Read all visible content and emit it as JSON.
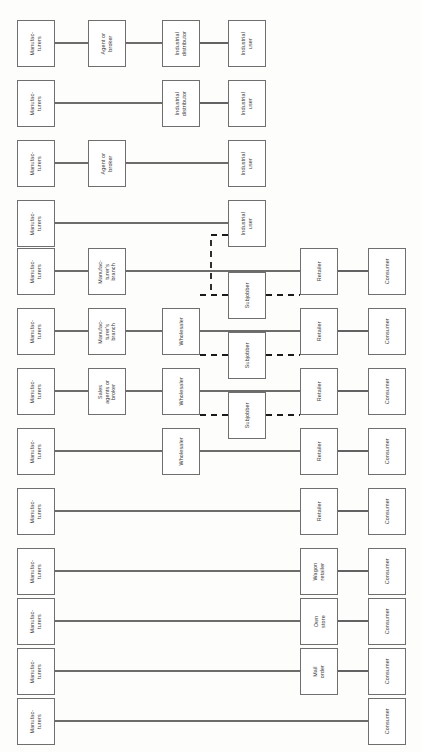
{
  "diagram": {
    "orientation": "rotated-90",
    "colors": {
      "box_border": "#6f6f6f",
      "box_fill": "#ffffff",
      "line": "#3b3b3b",
      "dashed_line": "#1a1a1a",
      "page_bg": "#fdfdfc",
      "text": "#3c3c3c"
    },
    "labels": {
      "manufacturers": "Manufac-\nturers",
      "agent_or_broker": "Agent or\nbroker",
      "industrial_distributor": "Industrial\ndistributor",
      "industrial_user": "Industrial\nuser",
      "manufacturers_branch": "Manufac-\nturer's\nbranch",
      "sales_agents_or_broker": "Sales\nagents or\nbroker",
      "wholesaler": "Wholesaler",
      "subjobber": "Subjobber",
      "retailer": "Retailer",
      "consumer": "Consumer",
      "wagon_retailer": "Wagon\nretailer",
      "own_store": "Own\nstore",
      "mail_order": "Mail\norder"
    },
    "columns": [
      {
        "key": "c1",
        "x": 17,
        "w": 38
      },
      {
        "key": "c2",
        "x": 88,
        "w": 38
      },
      {
        "key": "c3",
        "x": 162,
        "w": 38
      },
      {
        "key": "c4",
        "x": 228,
        "w": 38
      },
      {
        "key": "c5",
        "x": 300,
        "w": 38
      },
      {
        "key": "c6",
        "x": 368,
        "w": 38
      }
    ],
    "rows": [
      {
        "index": 1,
        "y": 20,
        "h": 47,
        "name": "manufacturer-agent-distributor-user",
        "nodes": [
          {
            "col": "c1",
            "label_key": "manufacturers",
            "name": "manufacturers-box"
          },
          {
            "col": "c2",
            "label_key": "agent_or_broker",
            "name": "agent-or-broker-box"
          },
          {
            "col": "c3",
            "label_key": "industrial_distributor",
            "name": "industrial-distributor-box"
          },
          {
            "col": "c4",
            "label_key": "industrial_user",
            "name": "industrial-user-box"
          }
        ]
      },
      {
        "index": 2,
        "y": 80,
        "h": 47,
        "name": "manufacturer-distributor-user",
        "nodes": [
          {
            "col": "c1",
            "label_key": "manufacturers",
            "name": "manufacturers-box"
          },
          {
            "col": "c3",
            "label_key": "industrial_distributor",
            "name": "industrial-distributor-box"
          },
          {
            "col": "c4",
            "label_key": "industrial_user",
            "name": "industrial-user-box"
          }
        ]
      },
      {
        "index": 3,
        "y": 140,
        "h": 47,
        "name": "manufacturer-agent-user",
        "nodes": [
          {
            "col": "c1",
            "label_key": "manufacturers",
            "name": "manufacturers-box"
          },
          {
            "col": "c2",
            "label_key": "agent_or_broker",
            "name": "agent-or-broker-box"
          },
          {
            "col": "c4",
            "label_key": "industrial_user",
            "name": "industrial-user-box"
          }
        ]
      },
      {
        "index": 4,
        "y": 200,
        "h": 47,
        "name": "manufacturer-user-direct",
        "nodes": [
          {
            "col": "c1",
            "label_key": "manufacturers",
            "name": "manufacturers-box"
          },
          {
            "col": "c4",
            "label_key": "industrial_user",
            "name": "industrial-user-box"
          }
        ]
      },
      {
        "index": 5,
        "y": 248,
        "h": 47,
        "name": "manufacturer-branch-retailer-consumer",
        "nodes": [
          {
            "col": "c1",
            "label_key": "manufacturers",
            "name": "manufacturers-box"
          },
          {
            "col": "c2",
            "label_key": "manufacturers_branch",
            "name": "manufacturers-branch-box"
          },
          {
            "col": "c5",
            "label_key": "retailer",
            "name": "retailer-box"
          },
          {
            "col": "c6",
            "label_key": "consumer",
            "name": "consumer-box"
          }
        ]
      },
      {
        "index": 6,
        "y": 308,
        "h": 47,
        "name": "manufacturer-branch-wholesaler-retailer-consumer",
        "nodes": [
          {
            "col": "c1",
            "label_key": "manufacturers",
            "name": "manufacturers-box"
          },
          {
            "col": "c2",
            "label_key": "manufacturers_branch",
            "name": "manufacturers-branch-box"
          },
          {
            "col": "c3",
            "label_key": "wholesaler",
            "name": "wholesaler-box"
          },
          {
            "col": "c5",
            "label_key": "retailer",
            "name": "retailer-box"
          },
          {
            "col": "c6",
            "label_key": "consumer",
            "name": "consumer-box"
          }
        ]
      },
      {
        "index": 7,
        "y": 368,
        "h": 47,
        "name": "manufacturer-salesagents-wholesaler-retailer-consumer",
        "nodes": [
          {
            "col": "c1",
            "label_key": "manufacturers",
            "name": "manufacturers-box"
          },
          {
            "col": "c2",
            "label_key": "sales_agents_or_broker",
            "name": "sales-agents-or-broker-box"
          },
          {
            "col": "c3",
            "label_key": "wholesaler",
            "name": "wholesaler-box"
          },
          {
            "col": "c5",
            "label_key": "retailer",
            "name": "retailer-box"
          },
          {
            "col": "c6",
            "label_key": "consumer",
            "name": "consumer-box"
          }
        ]
      },
      {
        "index": 8,
        "y": 428,
        "h": 47,
        "name": "manufacturer-wholesaler-retailer-consumer",
        "nodes": [
          {
            "col": "c1",
            "label_key": "manufacturers",
            "name": "manufacturers-box"
          },
          {
            "col": "c3",
            "label_key": "wholesaler",
            "name": "wholesaler-box"
          },
          {
            "col": "c5",
            "label_key": "retailer",
            "name": "retailer-box"
          },
          {
            "col": "c6",
            "label_key": "consumer",
            "name": "consumer-box"
          }
        ]
      },
      {
        "index": 9,
        "y": 488,
        "h": 47,
        "name": "manufacturer-retailer-consumer",
        "nodes": [
          {
            "col": "c1",
            "label_key": "manufacturers",
            "name": "manufacturers-box"
          },
          {
            "col": "c5",
            "label_key": "retailer",
            "name": "retailer-box"
          },
          {
            "col": "c6",
            "label_key": "consumer",
            "name": "consumer-box"
          }
        ]
      },
      {
        "index": 10,
        "y": 548,
        "h": 47,
        "name": "manufacturer-wagonretailer-consumer",
        "nodes": [
          {
            "col": "c1",
            "label_key": "manufacturers",
            "name": "manufacturers-box"
          },
          {
            "col": "c5",
            "label_key": "wagon_retailer",
            "name": "wagon-retailer-box"
          },
          {
            "col": "c6",
            "label_key": "consumer",
            "name": "consumer-box"
          }
        ]
      },
      {
        "index": 11,
        "y": 598,
        "h": 47,
        "name": "manufacturer-ownstore-consumer",
        "nodes": [
          {
            "col": "c1",
            "label_key": "manufacturers",
            "name": "manufacturers-box"
          },
          {
            "col": "c5",
            "label_key": "own_store",
            "name": "own-store-box"
          },
          {
            "col": "c6",
            "label_key": "consumer",
            "name": "consumer-box"
          }
        ]
      },
      {
        "index": 12,
        "y": 648,
        "h": 47,
        "name": "manufacturer-mailorder-consumer",
        "nodes": [
          {
            "col": "c1",
            "label_key": "manufacturers",
            "name": "manufacturers-box"
          },
          {
            "col": "c5",
            "label_key": "mail_order",
            "name": "mail-order-box"
          },
          {
            "col": "c6",
            "label_key": "consumer",
            "name": "consumer-box"
          }
        ]
      },
      {
        "index": 13,
        "y": 698,
        "h": 47,
        "name": "manufacturer-consumer-direct",
        "nodes": [
          {
            "col": "c1",
            "label_key": "manufacturers",
            "name": "manufacturers-box"
          },
          {
            "col": "c6",
            "label_key": "consumer",
            "name": "consumer-box"
          }
        ]
      }
    ],
    "subjobbers": [
      {
        "x": 228,
        "y": 272,
        "w": 38,
        "h": 47,
        "label_key": "subjobber",
        "name": "subjobber-box"
      },
      {
        "x": 228,
        "y": 332,
        "w": 38,
        "h": 47,
        "label_key": "subjobber",
        "name": "subjobber-box"
      },
      {
        "x": 228,
        "y": 392,
        "w": 38,
        "h": 47,
        "label_key": "subjobber",
        "name": "subjobber-box"
      }
    ],
    "solid_connectors": [
      {
        "x1": 55,
        "y1": 43,
        "x2": 88,
        "y2": 43
      },
      {
        "x1": 126,
        "y1": 43,
        "x2": 162,
        "y2": 43
      },
      {
        "x1": 200,
        "y1": 43,
        "x2": 228,
        "y2": 43
      },
      {
        "x1": 55,
        "y1": 103,
        "x2": 162,
        "y2": 103
      },
      {
        "x1": 200,
        "y1": 103,
        "x2": 228,
        "y2": 103
      },
      {
        "x1": 55,
        "y1": 163,
        "x2": 88,
        "y2": 163
      },
      {
        "x1": 126,
        "y1": 163,
        "x2": 228,
        "y2": 163
      },
      {
        "x1": 55,
        "y1": 223,
        "x2": 228,
        "y2": 223
      },
      {
        "x1": 55,
        "y1": 271,
        "x2": 88,
        "y2": 271
      },
      {
        "x1": 126,
        "y1": 271,
        "x2": 300,
        "y2": 271
      },
      {
        "x1": 338,
        "y1": 271,
        "x2": 368,
        "y2": 271
      },
      {
        "x1": 55,
        "y1": 331,
        "x2": 88,
        "y2": 331
      },
      {
        "x1": 126,
        "y1": 331,
        "x2": 162,
        "y2": 331
      },
      {
        "x1": 200,
        "y1": 331,
        "x2": 300,
        "y2": 331
      },
      {
        "x1": 338,
        "y1": 331,
        "x2": 368,
        "y2": 331
      },
      {
        "x1": 55,
        "y1": 391,
        "x2": 88,
        "y2": 391
      },
      {
        "x1": 126,
        "y1": 391,
        "x2": 162,
        "y2": 391
      },
      {
        "x1": 200,
        "y1": 391,
        "x2": 300,
        "y2": 391
      },
      {
        "x1": 338,
        "y1": 391,
        "x2": 368,
        "y2": 391
      },
      {
        "x1": 55,
        "y1": 451,
        "x2": 162,
        "y2": 451
      },
      {
        "x1": 200,
        "y1": 451,
        "x2": 300,
        "y2": 451
      },
      {
        "x1": 338,
        "y1": 451,
        "x2": 368,
        "y2": 451
      },
      {
        "x1": 55,
        "y1": 511,
        "x2": 300,
        "y2": 511
      },
      {
        "x1": 338,
        "y1": 511,
        "x2": 368,
        "y2": 511
      },
      {
        "x1": 55,
        "y1": 571,
        "x2": 300,
        "y2": 571
      },
      {
        "x1": 338,
        "y1": 571,
        "x2": 368,
        "y2": 571
      },
      {
        "x1": 55,
        "y1": 621,
        "x2": 300,
        "y2": 621
      },
      {
        "x1": 338,
        "y1": 621,
        "x2": 368,
        "y2": 621
      },
      {
        "x1": 55,
        "y1": 671,
        "x2": 300,
        "y2": 671
      },
      {
        "x1": 338,
        "y1": 671,
        "x2": 368,
        "y2": 671
      },
      {
        "x1": 55,
        "y1": 721,
        "x2": 368,
        "y2": 721
      }
    ],
    "dashed_connectors": [
      {
        "points": "228,235 211,235 211,295 228,295",
        "name": "industrial-user-to-subjobber-dashed"
      },
      {
        "points": "200,295 228,295",
        "name": "wholesaler-to-subjobber-dashed-1"
      },
      {
        "points": "266,295 300,295",
        "name": "subjobber-to-retailer-dashed-1"
      },
      {
        "points": "200,355 228,355",
        "name": "wholesaler-to-subjobber-dashed-2"
      },
      {
        "points": "266,355 300,355",
        "name": "subjobber-to-retailer-dashed-2"
      },
      {
        "points": "200,415 228,415",
        "name": "wholesaler-to-subjobber-dashed-3"
      },
      {
        "points": "266,415 300,415",
        "name": "subjobber-to-retailer-dashed-3"
      }
    ]
  }
}
